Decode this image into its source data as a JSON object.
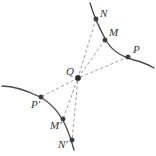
{
  "figure": {
    "width": 156,
    "height": 156,
    "background_color": "#ffffff",
    "curve_color": "#4a4a4a",
    "ray_color": "#8a8a8a",
    "point_color": "#3d3d3d",
    "label_color": "#353535"
  },
  "points": [
    {
      "id": "N",
      "label": "N",
      "x": 96,
      "y": 19,
      "label_x": 100,
      "label_y": 8,
      "on_curve": "upper"
    },
    {
      "id": "M",
      "label": "M",
      "x": 105,
      "y": 40,
      "label_x": 109,
      "label_y": 27,
      "on_curve": "upper"
    },
    {
      "id": "P",
      "label": "P",
      "x": 128,
      "y": 57,
      "label_x": 133,
      "label_y": 44,
      "on_curve": "upper"
    },
    {
      "id": "Q",
      "label": "Q",
      "x": 78,
      "y": 78,
      "label_x": 66,
      "label_y": 66,
      "on_curve": "pole"
    },
    {
      "id": "Pp",
      "label": "P'",
      "x": 41,
      "y": 97,
      "label_x": 31,
      "label_y": 99,
      "on_curve": "lower"
    },
    {
      "id": "Mp",
      "label": "M'",
      "x": 63,
      "y": 119,
      "label_x": 50,
      "label_y": 120,
      "on_curve": "lower"
    },
    {
      "id": "Np",
      "label": "N'",
      "x": 72,
      "y": 140,
      "label_x": 58,
      "label_y": 139,
      "on_curve": "lower"
    }
  ],
  "curves": [
    {
      "id": "upper-arc",
      "name": "upper-right-arc",
      "path": "M 90 3 C 93 13 99 28 107 42 C 114 53 124 57 134 60 C 142 62 149 65 154 68"
    },
    {
      "id": "lower-arc",
      "name": "lower-left-arc",
      "path": "M 2 86 C 12 86 26 90 40 97 C 53 104 62 117 67 129 C 70 136 72 142 74 150"
    }
  ],
  "rays": [
    {
      "id": "ray-N-Np",
      "name": "ray-through-N-and-N-prime",
      "path": "M 96 19 L 78 78 L 72 140"
    },
    {
      "id": "ray-M-Mp",
      "name": "ray-through-M-and-M-prime",
      "path": "M 105 40 L 78 78 L 63 119"
    },
    {
      "id": "ray-P-Pp",
      "name": "ray-through-P-and-P-prime",
      "path": "M 128 57 L 78 78 L 41 97"
    }
  ]
}
